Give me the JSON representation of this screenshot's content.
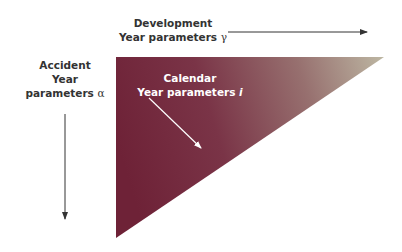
{
  "diagram": {
    "type": "run-off triangle",
    "labels": {
      "development": {
        "line1": "Development",
        "line2": "Year parameters",
        "symbol": "γ"
      },
      "accident": {
        "line1": "Accident",
        "line2": "Year",
        "line3": "parameters",
        "symbol": "α"
      },
      "calendar": {
        "line1": "Calendar",
        "line2": "Year parameters",
        "symbol": "i"
      }
    },
    "colors": {
      "triangle_dark": "#6e2237",
      "triangle_light": "#b9b3a0",
      "arrow": "#333333",
      "text": "#333333",
      "inner_text": "#ffffff"
    }
  }
}
